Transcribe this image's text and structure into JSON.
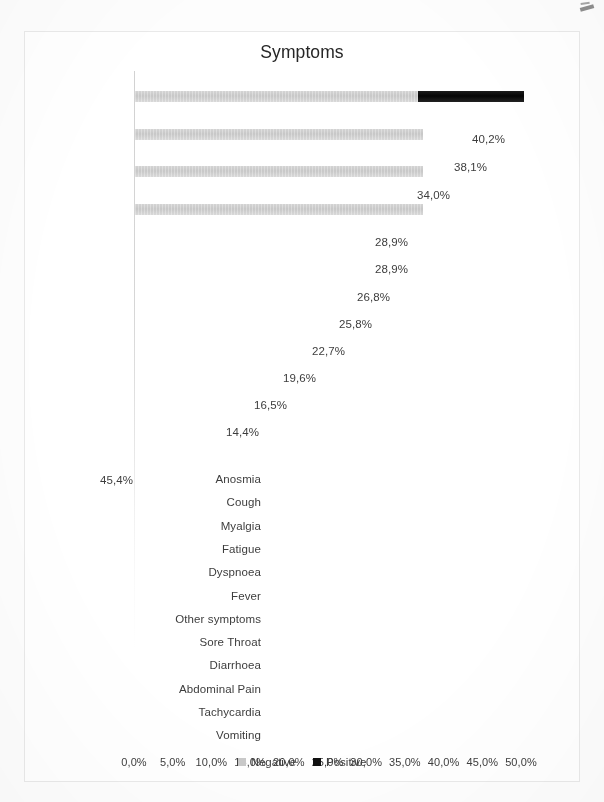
{
  "chart": {
    "title": "Symptoms",
    "legend": [
      {
        "label": "Negative",
        "color": "#c9c9c9"
      },
      {
        "label": "Positive",
        "color": "#101010"
      }
    ]
  },
  "chart_data": {
    "type": "bar",
    "orientation": "horizontal",
    "stacked": true,
    "title": "Symptoms",
    "xlabel": "",
    "ylabel": "",
    "xlim": [
      0,
      50
    ],
    "grid": false,
    "legend_position": "bottom",
    "tick_labels": [
      "0,0%",
      "5,0%",
      "10,0%",
      "15,0%",
      "20,0%",
      "25,0%",
      "30,0%",
      "35,0%",
      "40,0%",
      "45,0%",
      "50,0%"
    ],
    "tick_values": [
      0,
      5,
      10,
      15,
      20,
      25,
      30,
      35,
      40,
      45,
      50
    ],
    "categories": [
      "Anosmia",
      "Cough",
      "Myalgia",
      "Fatigue",
      "Dyspnoea",
      "Fever",
      "Other symptoms",
      "Sore Throat",
      "Diarrhoea",
      "Abdominal Pain",
      "Tachycardia",
      "Vomiting"
    ],
    "data_labels": [
      "45,4%",
      "40,2%",
      "38,1%",
      "34,0%",
      "28,9%",
      "28,9%",
      "26,8%",
      "25,8%",
      "22,7%",
      "19,6%",
      "16,5%",
      "14,4%"
    ],
    "series": [
      {
        "name": "Negative",
        "color": "#c9c9c9",
        "values": [
          36.5,
          40.2,
          38.1,
          34.0,
          28.9,
          28.9,
          26.8,
          25.8,
          22.7,
          19.6,
          16.5,
          14.4
        ]
      },
      {
        "name": "Positive",
        "color": "#101010",
        "values": [
          45.4,
          0,
          0,
          0,
          0,
          0,
          0,
          0,
          0,
          0,
          0,
          0
        ]
      }
    ],
    "rendered_bars": [
      {
        "index": 0,
        "neg_end_pct": 36.5,
        "pos_end_pct": 50.2
      },
      {
        "index": 1,
        "neg_end_pct": 37.2,
        "pos_end_pct": 0
      },
      {
        "index": 2,
        "neg_end_pct": 37.2,
        "pos_end_pct": 0
      },
      {
        "index": 3,
        "neg_end_pct": 37.2,
        "pos_end_pct": 0
      }
    ]
  }
}
